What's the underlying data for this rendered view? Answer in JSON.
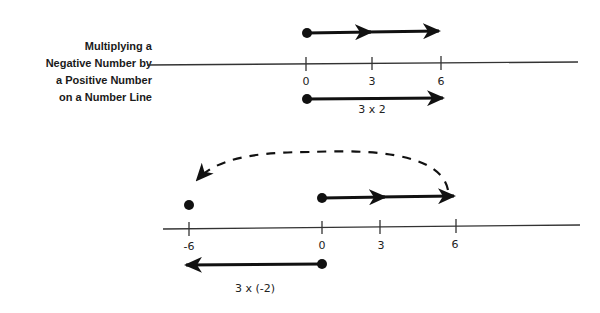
{
  "title": {
    "lines": [
      "Multiplying a",
      "Negative Number by",
      "a Positive Number",
      "on a Number Line"
    ]
  },
  "diagram_top": {
    "tick_labels": [
      "0",
      "3",
      "6"
    ],
    "operation_label": "3 x 2"
  },
  "diagram_bottom": {
    "tick_labels": [
      "-6",
      "0",
      "3",
      "6"
    ],
    "operation_label": "3 x (-2)"
  },
  "colors": {
    "ink": "#111111",
    "axis": "#333333",
    "background": "#ffffff"
  }
}
